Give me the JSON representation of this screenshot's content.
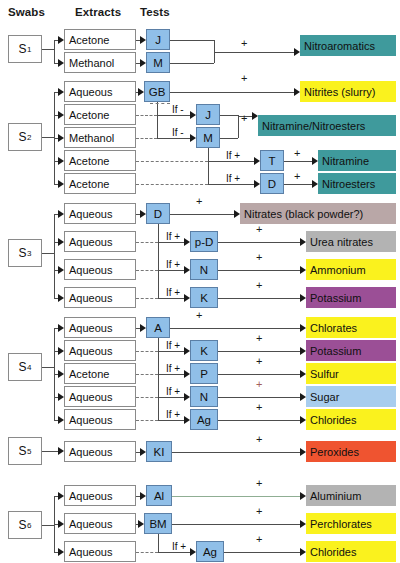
{
  "diagram": {
    "headers": [
      {
        "label": "Swabs",
        "x": 8,
        "y": 6
      },
      {
        "label": "Extracts",
        "x": 75,
        "y": 6
      },
      {
        "label": "Tests",
        "x": 140,
        "y": 6
      }
    ],
    "colors": {
      "test_fill": "#90bfe8",
      "test_stroke": "#5b7fa6",
      "box_stroke": "#8a8a8a",
      "line": "#4d4d4d",
      "teal": "#3f9a9c",
      "yellow": "#faf21e",
      "grey": "#b3b3b3",
      "mauve": "#b9a7a7",
      "purple": "#9b4f96",
      "blue": "#a8cdee",
      "orange": "#ef5430"
    },
    "swabs": [
      {
        "id": "s1",
        "label": "S",
        "sub": "1",
        "x": 8,
        "y": 35,
        "w": 34,
        "h": 28
      },
      {
        "id": "s2",
        "label": "S",
        "sub": "2",
        "x": 8,
        "y": 123,
        "w": 34,
        "h": 28
      },
      {
        "id": "s3",
        "label": "S",
        "sub": "3",
        "x": 8,
        "y": 239,
        "w": 34,
        "h": 28
      },
      {
        "id": "s4",
        "label": "S",
        "sub": "4",
        "x": 8,
        "y": 353,
        "w": 34,
        "h": 28
      },
      {
        "id": "s5",
        "label": "S",
        "sub": "5",
        "x": 8,
        "y": 437,
        "w": 34,
        "h": 28
      },
      {
        "id": "s6",
        "label": "S",
        "sub": "6",
        "x": 8,
        "y": 511,
        "w": 34,
        "h": 28
      }
    ],
    "extracts": [
      {
        "label": "Acetone",
        "x": 64,
        "y": 29,
        "w": 72,
        "h": 21
      },
      {
        "label": "Methanol",
        "x": 64,
        "y": 52,
        "w": 72,
        "h": 21
      },
      {
        "label": "Aqueous",
        "x": 64,
        "y": 81,
        "w": 72,
        "h": 21
      },
      {
        "label": "Acetone",
        "x": 64,
        "y": 104,
        "w": 72,
        "h": 21
      },
      {
        "label": "Methanol",
        "x": 64,
        "y": 127,
        "w": 72,
        "h": 21
      },
      {
        "label": "Acetone",
        "x": 64,
        "y": 150,
        "w": 72,
        "h": 21
      },
      {
        "label": "Acetone",
        "x": 64,
        "y": 173,
        "w": 72,
        "h": 21
      },
      {
        "label": "Aqueous",
        "x": 64,
        "y": 203,
        "w": 72,
        "h": 21
      },
      {
        "label": "Aqueous",
        "x": 64,
        "y": 231,
        "w": 72,
        "h": 21
      },
      {
        "label": "Aqueous",
        "x": 64,
        "y": 259,
        "w": 72,
        "h": 21
      },
      {
        "label": "Aqueous",
        "x": 64,
        "y": 287,
        "w": 72,
        "h": 21
      },
      {
        "label": "Aqueous",
        "x": 64,
        "y": 317,
        "w": 72,
        "h": 21
      },
      {
        "label": "Aqueous",
        "x": 64,
        "y": 340,
        "w": 72,
        "h": 21
      },
      {
        "label": "Acetone",
        "x": 64,
        "y": 363,
        "w": 72,
        "h": 21
      },
      {
        "label": "Aqueous",
        "x": 64,
        "y": 386,
        "w": 72,
        "h": 21
      },
      {
        "label": "Aqueous",
        "x": 64,
        "y": 409,
        "w": 72,
        "h": 21
      },
      {
        "label": "Aqueous",
        "x": 64,
        "y": 441,
        "w": 72,
        "h": 21
      },
      {
        "label": "Aqueous",
        "x": 64,
        "y": 485,
        "w": 72,
        "h": 21
      },
      {
        "label": "Aqueous",
        "x": 64,
        "y": 513,
        "w": 72,
        "h": 21
      },
      {
        "label": "Aqueous",
        "x": 64,
        "y": 541,
        "w": 72,
        "h": 21
      }
    ],
    "tests": [
      {
        "label": "J",
        "x": 146,
        "y": 29,
        "w": 24,
        "h": 21
      },
      {
        "label": "M",
        "x": 146,
        "y": 52,
        "w": 24,
        "h": 21
      },
      {
        "label": "GB",
        "x": 144,
        "y": 81,
        "w": 26,
        "h": 21
      },
      {
        "label": "J",
        "x": 196,
        "y": 104,
        "w": 24,
        "h": 21
      },
      {
        "label": "M",
        "x": 196,
        "y": 127,
        "w": 24,
        "h": 21
      },
      {
        "label": "T",
        "x": 260,
        "y": 150,
        "w": 24,
        "h": 21
      },
      {
        "label": "D",
        "x": 260,
        "y": 173,
        "w": 24,
        "h": 21
      },
      {
        "label": "D",
        "x": 146,
        "y": 203,
        "w": 24,
        "h": 21
      },
      {
        "label": "p-D",
        "x": 190,
        "y": 231,
        "w": 28,
        "h": 21
      },
      {
        "label": "N",
        "x": 190,
        "y": 259,
        "w": 28,
        "h": 21
      },
      {
        "label": "K",
        "x": 190,
        "y": 287,
        "w": 28,
        "h": 21
      },
      {
        "label": "A",
        "x": 146,
        "y": 317,
        "w": 24,
        "h": 21
      },
      {
        "label": "K",
        "x": 190,
        "y": 340,
        "w": 28,
        "h": 21
      },
      {
        "label": "P",
        "x": 190,
        "y": 363,
        "w": 28,
        "h": 21
      },
      {
        "label": "N",
        "x": 190,
        "y": 386,
        "w": 28,
        "h": 21
      },
      {
        "label": "Ag",
        "x": 190,
        "y": 409,
        "w": 28,
        "h": 21
      },
      {
        "label": "KI",
        "x": 146,
        "y": 441,
        "w": 26,
        "h": 21
      },
      {
        "label": "Al",
        "x": 146,
        "y": 485,
        "w": 26,
        "h": 21
      },
      {
        "label": "BM",
        "x": 144,
        "y": 513,
        "w": 28,
        "h": 21
      },
      {
        "label": "Ag",
        "x": 196,
        "y": 541,
        "w": 28,
        "h": 21
      }
    ],
    "results": [
      {
        "label": "Nitroaromatics",
        "x": 300,
        "y": 35,
        "w": 96,
        "h": 21,
        "color": "#3f9a9c"
      },
      {
        "label": "Nitrites (slurry)",
        "x": 300,
        "y": 81,
        "w": 96,
        "h": 21,
        "color": "#faf21e"
      },
      {
        "label": "Nitramine/Nitroesters",
        "x": 258,
        "y": 115,
        "w": 138,
        "h": 21,
        "color": "#3f9a9c"
      },
      {
        "label": "Nitramine",
        "x": 318,
        "y": 150,
        "w": 78,
        "h": 21,
        "color": "#3f9a9c"
      },
      {
        "label": "Nitroesters",
        "x": 318,
        "y": 173,
        "w": 78,
        "h": 21,
        "color": "#3f9a9c"
      },
      {
        "label": "Nitrates (black powder?)",
        "x": 240,
        "y": 203,
        "w": 156,
        "h": 21,
        "color": "#b9a7a7"
      },
      {
        "label": "Urea nitrates",
        "x": 306,
        "y": 231,
        "w": 90,
        "h": 21,
        "color": "#b3b3b3"
      },
      {
        "label": "Ammonium",
        "x": 306,
        "y": 259,
        "w": 90,
        "h": 21,
        "color": "#faf21e"
      },
      {
        "label": "Potassium",
        "x": 306,
        "y": 287,
        "w": 90,
        "h": 21,
        "color": "#9b4f96"
      },
      {
        "label": "Chlorates",
        "x": 306,
        "y": 317,
        "w": 90,
        "h": 21,
        "color": "#faf21e"
      },
      {
        "label": "Potassium",
        "x": 306,
        "y": 340,
        "w": 90,
        "h": 21,
        "color": "#9b4f96"
      },
      {
        "label": "Sulfur",
        "x": 306,
        "y": 363,
        "w": 90,
        "h": 21,
        "color": "#faf21e"
      },
      {
        "label": "Sugar",
        "x": 306,
        "y": 386,
        "w": 90,
        "h": 21,
        "color": "#a8cdee"
      },
      {
        "label": "Chlorides",
        "x": 306,
        "y": 409,
        "w": 90,
        "h": 21,
        "color": "#faf21e"
      },
      {
        "label": "Peroxides",
        "x": 306,
        "y": 441,
        "w": 90,
        "h": 21,
        "color": "#ef5430"
      },
      {
        "label": "Aluminium",
        "x": 306,
        "y": 485,
        "w": 90,
        "h": 21,
        "color": "#b3b3b3"
      },
      {
        "label": "Perchlorates",
        "x": 306,
        "y": 513,
        "w": 90,
        "h": 21,
        "color": "#faf21e"
      },
      {
        "label": "Chlorides",
        "x": 306,
        "y": 541,
        "w": 90,
        "h": 21,
        "color": "#faf21e"
      }
    ],
    "conditions": [
      {
        "label": "If -",
        "x": 172,
        "y": 104
      },
      {
        "label": "If -",
        "x": 172,
        "y": 127
      },
      {
        "label": "If +",
        "x": 226,
        "y": 150
      },
      {
        "label": "If +",
        "x": 226,
        "y": 173
      },
      {
        "label": "If +",
        "x": 166,
        "y": 231
      },
      {
        "label": "If +",
        "x": 166,
        "y": 259
      },
      {
        "label": "If +",
        "x": 166,
        "y": 287
      },
      {
        "label": "If +",
        "x": 166,
        "y": 340
      },
      {
        "label": "If +",
        "x": 166,
        "y": 363
      },
      {
        "label": "If +",
        "x": 166,
        "y": 386
      },
      {
        "label": "If +",
        "x": 166,
        "y": 409
      },
      {
        "label": "If +",
        "x": 172,
        "y": 541
      }
    ],
    "pluses": [
      {
        "label": "+",
        "x": 241,
        "y": 38,
        "red": false
      },
      {
        "label": "+",
        "x": 241,
        "y": 73,
        "red": false
      },
      {
        "label": "+",
        "x": 241,
        "y": 113,
        "red": false
      },
      {
        "label": "+",
        "x": 294,
        "y": 148,
        "red": false
      },
      {
        "label": "+",
        "x": 294,
        "y": 171,
        "red": false
      },
      {
        "label": "+",
        "x": 196,
        "y": 196,
        "red": false
      },
      {
        "label": "+",
        "x": 256,
        "y": 224,
        "red": false
      },
      {
        "label": "+",
        "x": 256,
        "y": 252,
        "red": false
      },
      {
        "label": "+",
        "x": 256,
        "y": 280,
        "red": false
      },
      {
        "label": "+",
        "x": 196,
        "y": 310,
        "red": false
      },
      {
        "label": "+",
        "x": 256,
        "y": 333,
        "red": false
      },
      {
        "label": "+",
        "x": 256,
        "y": 356,
        "red": false
      },
      {
        "label": "+",
        "x": 256,
        "y": 379,
        "red": true
      },
      {
        "label": "+",
        "x": 256,
        "y": 402,
        "red": false
      },
      {
        "label": "+",
        "x": 256,
        "y": 434,
        "red": false
      },
      {
        "label": "+",
        "x": 256,
        "y": 478,
        "red": false
      },
      {
        "label": "+",
        "x": 256,
        "y": 506,
        "red": false
      },
      {
        "label": "+",
        "x": 256,
        "y": 534,
        "red": false
      }
    ]
  }
}
